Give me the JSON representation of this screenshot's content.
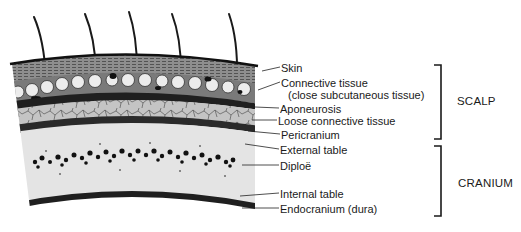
{
  "figure": {
    "type": "anatomical cross-section"
  },
  "labels": [
    {
      "id": "skin",
      "text": "Skin",
      "x": 281,
      "y": 62
    },
    {
      "id": "connective-tissue",
      "text": "Connective tissue",
      "x": 281,
      "y": 77
    },
    {
      "id": "connective-tissue-sub",
      "text": "(close subcutaneous tissue)",
      "x": 288,
      "y": 89
    },
    {
      "id": "aponeurosis",
      "text": "Aponeurosis",
      "x": 280,
      "y": 103
    },
    {
      "id": "loose-connective-tissue",
      "text": "Loose connective tissue",
      "x": 278,
      "y": 115
    },
    {
      "id": "pericranium",
      "text": "Pericranium",
      "x": 281,
      "y": 129
    },
    {
      "id": "external-table",
      "text": "External table",
      "x": 280,
      "y": 144
    },
    {
      "id": "diploe",
      "text": "Diploë",
      "x": 280,
      "y": 160
    },
    {
      "id": "internal-table",
      "text": "Internal table",
      "x": 280,
      "y": 188
    },
    {
      "id": "endocranium",
      "text": "Endocranium (dura)",
      "x": 280,
      "y": 203
    }
  ],
  "groups": [
    {
      "id": "scalp",
      "text": "SCALP",
      "x": 457,
      "y": 95,
      "bracket": {
        "x": 441,
        "top": 65,
        "bottom": 139
      }
    },
    {
      "id": "cranium",
      "text": "CRANIUM",
      "x": 458,
      "y": 177,
      "bracket": {
        "x": 441,
        "top": 146,
        "bottom": 216
      }
    }
  ],
  "colors": {
    "ink": "#1a1a1a",
    "skin_fill": "#8c8c8c",
    "connective_fill": "#6e6e6e",
    "fat_lobule": "#e8e8e8",
    "loose_fill": "#bdbdbd",
    "bone_fill": "#e6e6e6",
    "diploe_dots": "#111111"
  }
}
